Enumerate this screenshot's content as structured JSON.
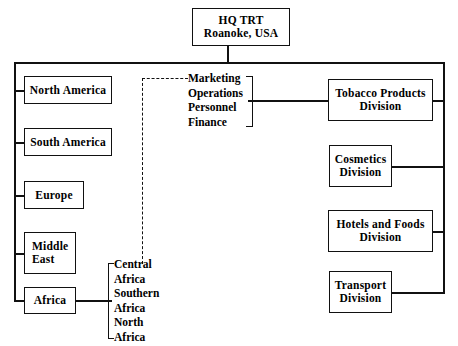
{
  "diagram": {
    "hq": {
      "line1": "HQ TRT",
      "line2": "Roanoke, USA"
    },
    "regions": [
      {
        "label": "North America"
      },
      {
        "label": "South America"
      },
      {
        "label": "Europe"
      },
      {
        "label_line1": "Middle",
        "label_line2": "East"
      },
      {
        "label": "Africa"
      }
    ],
    "functions": [
      {
        "label": "Marketing"
      },
      {
        "label": "Operations"
      },
      {
        "label": "Personnel"
      },
      {
        "label": "Finance"
      }
    ],
    "africa_units": [
      {
        "line1": "Central",
        "line2": "Africa"
      },
      {
        "line1": "Southern",
        "line2": "Africa"
      },
      {
        "line1": "North",
        "line2": "Africa"
      }
    ],
    "divisions": [
      {
        "line1": "Tobacco Products",
        "line2": "Division"
      },
      {
        "line1": "Cosmetics",
        "line2": "Division"
      },
      {
        "line1": "Hotels and Foods",
        "line2": "Division"
      },
      {
        "line1": "Transport",
        "line2": "Division"
      }
    ],
    "colors": {
      "ink": "#111111",
      "paper": "#ffffff"
    }
  }
}
